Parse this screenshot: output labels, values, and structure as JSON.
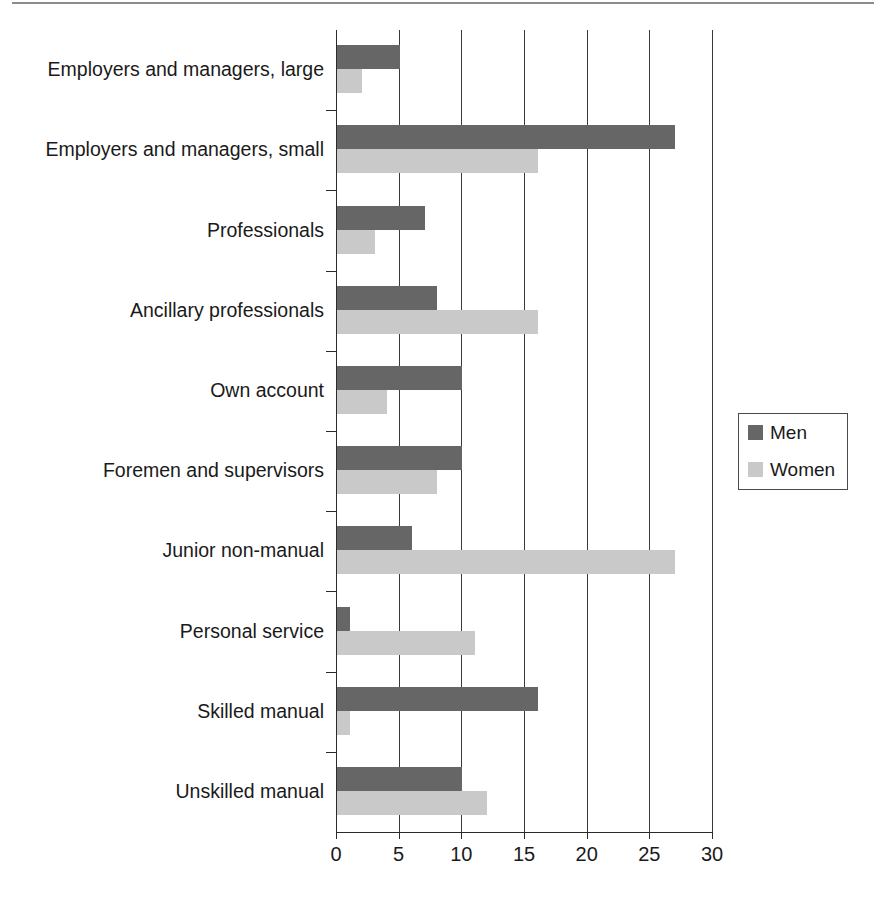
{
  "chart_data": {
    "type": "bar",
    "orientation": "horizontal",
    "title": "",
    "subtitle": "",
    "xlabel": "",
    "ylabel": "",
    "xlim": [
      0,
      30
    ],
    "xticks": [
      0,
      5,
      10,
      15,
      20,
      25,
      30
    ],
    "xticklabels": [
      "0",
      "5",
      "10",
      "15",
      "20",
      "25",
      "30"
    ],
    "grid": "vertical",
    "legend_position": "right",
    "categories": [
      "Employers and managers, large",
      "Employers and managers, small",
      "Professionals",
      "Ancillary professionals",
      "Own account",
      "Foremen and supervisors",
      "Junior non-manual",
      "Personal service",
      "Skilled manual",
      "Unskilled manual"
    ],
    "series": [
      {
        "name": "Men",
        "color": "#666666",
        "values": [
          5,
          27,
          7,
          8,
          10,
          10,
          6,
          1,
          16,
          10
        ]
      },
      {
        "name": "Women",
        "color": "#c9c9c9",
        "values": [
          2,
          16,
          3,
          16,
          4,
          8,
          27,
          11,
          1,
          12
        ]
      }
    ]
  },
  "legend": {
    "entries": [
      {
        "label": "Men",
        "color": "#666666"
      },
      {
        "label": "Women",
        "color": "#c9c9c9"
      }
    ]
  },
  "axis": {
    "x_tick_labels": [
      "0",
      "5",
      "10",
      "15",
      "20",
      "25",
      "30"
    ]
  }
}
